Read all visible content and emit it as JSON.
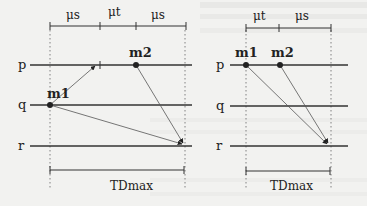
{
  "left_diagram": {
    "scale_labels": [
      "μs",
      "μt",
      "μs"
    ],
    "processes": [
      "p",
      "q",
      "r"
    ],
    "messages": [
      "m1",
      "m2"
    ],
    "duration_label": "TDmax"
  },
  "right_diagram": {
    "scale_labels": [
      "μt",
      "μs"
    ],
    "processes": [
      "p",
      "q",
      "r"
    ],
    "messages": [
      "m1",
      "m2"
    ],
    "duration_label": "TDmax"
  }
}
